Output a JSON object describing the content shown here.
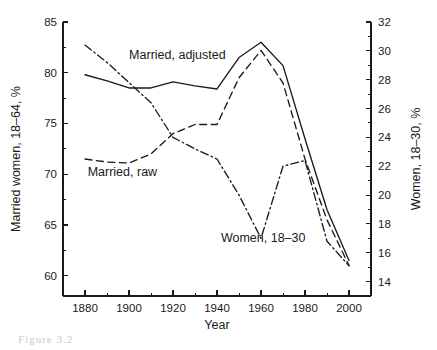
{
  "figure": {
    "background": "#ffffff",
    "ink_color": "#1a1a1a",
    "caption_partial": "Figure 3.2"
  },
  "chart_data": {
    "type": "line",
    "title": "",
    "xlabel": "Year",
    "ylabel": "Married women, 18–64, %",
    "y2label": "Women, 18–30, %",
    "grid": false,
    "legend_position": "inline-annotations",
    "xlim": [
      1870,
      2010
    ],
    "ylim": [
      58,
      85
    ],
    "y2lim": [
      13,
      32
    ],
    "xticks": [
      1880,
      1900,
      1920,
      1940,
      1960,
      1980,
      2000
    ],
    "xticklabels": [
      "1880",
      "1900",
      "1920",
      "1940",
      "1960",
      "1980",
      "2000"
    ],
    "xminorticks": [
      1870,
      1890,
      1910,
      1930,
      1950,
      1970,
      1990,
      2010
    ],
    "yticks": [
      60,
      65,
      70,
      75,
      80,
      85
    ],
    "yticklabels": [
      "60",
      "65",
      "70",
      "75",
      "80",
      "85"
    ],
    "y2ticks": [
      14,
      16,
      18,
      20,
      22,
      24,
      26,
      28,
      30,
      32
    ],
    "y2ticklabels": [
      "14",
      "16",
      "18",
      "20",
      "22",
      "24",
      "26",
      "28",
      "30",
      "32"
    ],
    "series": [
      {
        "name": "Married, adjusted",
        "axis": "left",
        "style": "solid",
        "label_x": 1922,
        "label_y": 81.4,
        "x": [
          1880,
          1890,
          1900,
          1910,
          1920,
          1930,
          1940,
          1950,
          1960,
          1970,
          1980,
          1990,
          2000
        ],
        "values": [
          79.8,
          79.2,
          78.5,
          78.5,
          79.1,
          78.7,
          78.4,
          81.5,
          83.0,
          80.7,
          73.5,
          66.5,
          61.5
        ]
      },
      {
        "name": "Married, raw",
        "axis": "left",
        "style": "dashed",
        "label_x": 1897,
        "label_y": 69.8,
        "x": [
          1880,
          1890,
          1900,
          1910,
          1920,
          1930,
          1940,
          1950,
          1960,
          1970,
          1980,
          1990,
          2000
        ],
        "values": [
          71.5,
          71.2,
          71.1,
          72.0,
          74.0,
          74.9,
          74.9,
          79.5,
          82.2,
          79.0,
          71.5,
          65.5,
          61.0
        ]
      },
      {
        "name": "Women, 18–30",
        "axis": "right",
        "style": "dashdot",
        "label_x": 1961,
        "label_y": 63.3,
        "x": [
          1880,
          1890,
          1900,
          1910,
          1920,
          1930,
          1940,
          1950,
          1960,
          1970,
          1980,
          1990,
          2000
        ],
        "values": [
          30.4,
          29.2,
          27.8,
          26.4,
          24.0,
          23.2,
          22.5,
          20.0,
          17.0,
          22.0,
          22.4,
          16.8,
          15.1
        ]
      }
    ]
  },
  "labels": {
    "x_title": "Year",
    "y_title": "Married women, 18–64, %",
    "y2_title": "Women, 18–30, %",
    "series_adjusted": "Married, adjusted",
    "series_raw": "Married, raw",
    "series_women": "Women, 18–30"
  }
}
